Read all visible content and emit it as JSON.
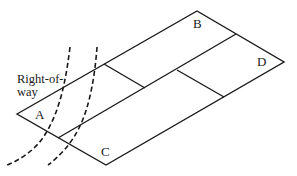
{
  "diagram": {
    "type": "parcel-layout",
    "stroke_color": "#1a1a1a",
    "background": "#ffffff",
    "labels": {
      "right_of_way_line1": "Right-of-",
      "right_of_way_line2": "way",
      "parcel_a": "A",
      "parcel_b": "B",
      "parcel_c": "C",
      "parcel_d": "D"
    },
    "outline": {
      "left": [
        17,
        114
      ],
      "top": [
        197,
        11
      ],
      "right": [
        284,
        62
      ],
      "bottom": [
        106,
        165
      ]
    },
    "parcels": [
      "A",
      "B",
      "C",
      "D"
    ],
    "right_of_way_boundaries": 2
  }
}
